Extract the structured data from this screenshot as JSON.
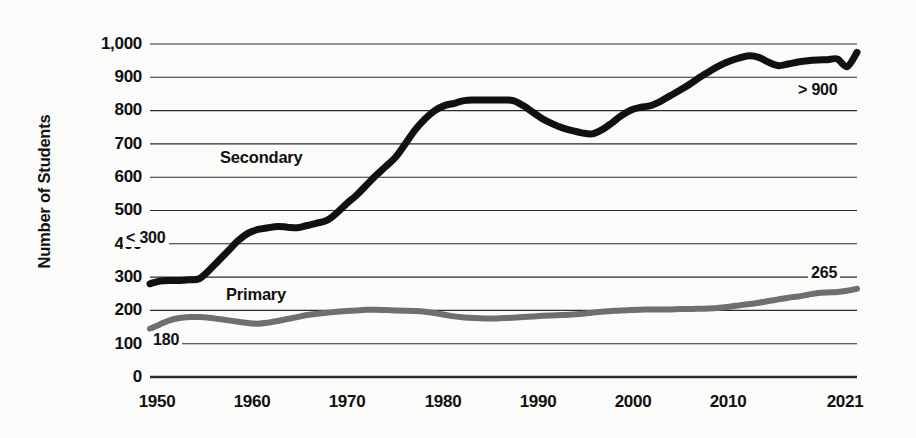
{
  "chart_data": {
    "type": "line",
    "title": "",
    "xlabel": "",
    "ylabel": "Number of Students",
    "xlim": [
      1949,
      2021
    ],
    "ylim": [
      0,
      1000
    ],
    "grid": true,
    "legend_position": "inline-labels",
    "y_ticks": [
      "1,000",
      "900",
      "800",
      "700",
      "600",
      "500",
      "400",
      "300",
      "200",
      "100",
      "0"
    ],
    "y_tick_values": [
      1000,
      900,
      800,
      700,
      600,
      500,
      400,
      300,
      200,
      100,
      0
    ],
    "x_ticks": [
      "1950",
      "1960",
      "1970",
      "1980",
      "1990",
      "2000",
      "2010",
      "2021"
    ],
    "x_tick_values": [
      1950,
      1960,
      1970,
      1980,
      1990,
      2000,
      2010,
      2021
    ],
    "annotations": [
      {
        "text": "< 300",
        "series": "Secondary",
        "position": "start",
        "value": 290
      },
      {
        "text": "> 900",
        "series": "Secondary",
        "position": "end",
        "value": 975
      },
      {
        "text": "180",
        "series": "Primary",
        "position": "start",
        "value": 180
      },
      {
        "text": "265",
        "series": "Primary",
        "position": "end",
        "value": 265
      }
    ],
    "series": [
      {
        "name": "Secondary",
        "color": "#111111",
        "stroke_width": 7,
        "x": [
          1949,
          1950,
          1951,
          1952,
          1953,
          1954,
          1955,
          1956,
          1957,
          1958,
          1959,
          1960,
          1961,
          1962,
          1963,
          1964,
          1965,
          1966,
          1967,
          1968,
          1969,
          1970,
          1971,
          1972,
          1973,
          1974,
          1975,
          1976,
          1977,
          1978,
          1979,
          1980,
          1981,
          1982,
          1983,
          1984,
          1985,
          1986,
          1987,
          1988,
          1989,
          1990,
          1991,
          1992,
          1993,
          1994,
          1995,
          1996,
          1997,
          1998,
          1999,
          2000,
          2001,
          2002,
          2003,
          2004,
          2005,
          2006,
          2007,
          2008,
          2009,
          2010,
          2011,
          2012,
          2013,
          2014,
          2015,
          2016,
          2017,
          2018,
          2019,
          2020,
          2021
        ],
        "values": [
          280,
          288,
          290,
          290,
          292,
          295,
          320,
          350,
          380,
          410,
          432,
          443,
          448,
          452,
          450,
          448,
          455,
          462,
          470,
          492,
          520,
          545,
          575,
          605,
          632,
          660,
          700,
          742,
          775,
          800,
          815,
          822,
          830,
          832,
          832,
          832,
          832,
          830,
          815,
          795,
          775,
          760,
          748,
          740,
          733,
          730,
          742,
          762,
          785,
          802,
          810,
          815,
          828,
          845,
          862,
          880,
          900,
          918,
          935,
          948,
          958,
          965,
          960,
          945,
          935,
          940,
          946,
          950,
          952,
          953,
          955,
          932,
          975
        ]
      },
      {
        "name": "Primary",
        "color": "#6f6f6f",
        "stroke_width": 6,
        "x": [
          1949,
          1950,
          1951,
          1952,
          1953,
          1954,
          1955,
          1956,
          1957,
          1958,
          1959,
          1960,
          1961,
          1962,
          1963,
          1964,
          1965,
          1966,
          1967,
          1968,
          1969,
          1970,
          1971,
          1972,
          1973,
          1974,
          1975,
          1976,
          1977,
          1978,
          1979,
          1980,
          1981,
          1982,
          1983,
          1984,
          1985,
          1986,
          1987,
          1988,
          1989,
          1990,
          1991,
          1992,
          1993,
          1994,
          1995,
          1996,
          1997,
          1998,
          1999,
          2000,
          2001,
          2002,
          2003,
          2004,
          2005,
          2006,
          2007,
          2008,
          2009,
          2010,
          2011,
          2012,
          2013,
          2014,
          2015,
          2016,
          2017,
          2018,
          2019,
          2020,
          2021
        ],
        "values": [
          145,
          158,
          170,
          177,
          180,
          180,
          178,
          174,
          170,
          166,
          162,
          160,
          163,
          168,
          174,
          180,
          186,
          190,
          193,
          196,
          198,
          200,
          202,
          202,
          201,
          200,
          199,
          198,
          196,
          192,
          187,
          182,
          179,
          177,
          176,
          176,
          177,
          178,
          180,
          182,
          184,
          185,
          186,
          188,
          190,
          193,
          196,
          198,
          200,
          201,
          202,
          203,
          203,
          203,
          204,
          204,
          205,
          206,
          208,
          211,
          215,
          219,
          223,
          228,
          233,
          238,
          242,
          247,
          252,
          254,
          255,
          259,
          265
        ]
      }
    ]
  }
}
